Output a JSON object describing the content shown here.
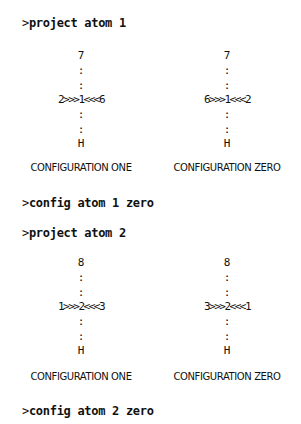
{
  "prompt_char": ">",
  "commands": [
    {
      "text": "project atom 1"
    },
    {
      "text": "config atom 1 zero"
    },
    {
      "text": "project atom 2"
    },
    {
      "text": "config atom 2 zero"
    }
  ],
  "groups": [
    {
      "configs": [
        {
          "top": "7",
          "sep": ":",
          "center": "2>>>1<<<6",
          "bottom": "H",
          "label": "CONFIGURATION ONE"
        },
        {
          "top": "7",
          "sep": ":",
          "center": "6>>>1<<<2",
          "bottom": "H",
          "label": "CONFIGURATION ZERO"
        }
      ]
    },
    {
      "configs": [
        {
          "top": "8",
          "sep": ":",
          "center": "1>>>2<<<3",
          "bottom": "H",
          "label": "CONFIGURATION ONE"
        },
        {
          "top": "8",
          "sep": ":",
          "center": "3>>>2<<<1",
          "bottom": "H",
          "label": "CONFIGURATION ZERO"
        }
      ]
    }
  ]
}
